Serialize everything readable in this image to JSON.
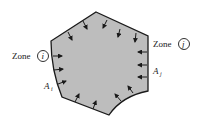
{
  "diagram": {
    "fill_color": "#bdbdbd",
    "stroke_color": "#1a1a1a",
    "labels": {
      "zone_left_word": "Zone",
      "zone_left_index": "i",
      "zone_right_word": "Zone",
      "zone_right_index": "j",
      "area_left_main": "A",
      "area_left_sub": "i",
      "area_right_main": "A",
      "area_right_sub": "j"
    }
  }
}
